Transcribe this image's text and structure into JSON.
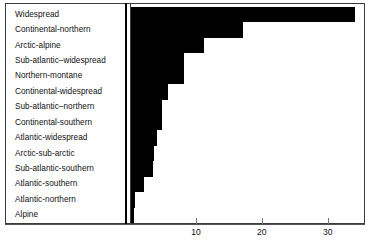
{
  "chart_data": {
    "type": "bar",
    "orientation": "horizontal",
    "title": "",
    "subtitle": "",
    "xlabel": "",
    "ylabel": "",
    "grid": false,
    "legend": null,
    "xlim": [
      0,
      35.5
    ],
    "xticks": [
      10,
      20,
      30
    ],
    "xtick_labels": [
      "10",
      "20",
      "30"
    ],
    "categories": [
      "Widespread",
      "Continental-northern",
      "Arctic-alpine",
      "Sub-atlantic–widespread",
      "Northern-montane",
      "Continental-widespread",
      "Sub-atlantic–northern",
      "Continental-southern",
      "Atlantic-widespread",
      "Arctic-sub-arctic",
      "Sub-atlantic-southern",
      "Atlantic-southern",
      "Atlantic-northern",
      "Alpine"
    ],
    "values": [
      34,
      17,
      11,
      8,
      8,
      5.6,
      4.7,
      4.7,
      4,
      3.5,
      3.3,
      2,
      0.6,
      0.4
    ],
    "bar_color": "#000000",
    "axis_color": "#3c3c3c",
    "background_color": "#ffffff"
  }
}
